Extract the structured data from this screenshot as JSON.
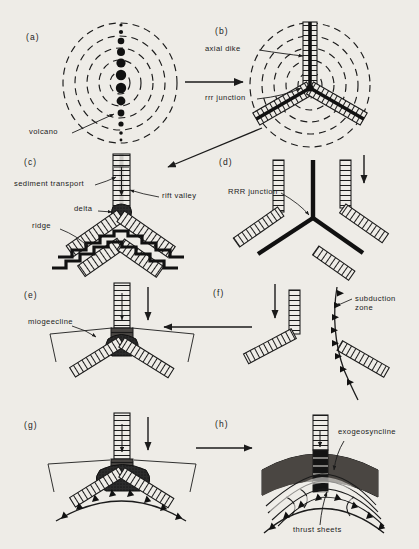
{
  "figure": {
    "background_color": "#eeece7",
    "ink_color": "#1b1b1b"
  },
  "panels": [
    {
      "id": "a",
      "letter": "(a)",
      "description": "Domal uplift with concentric dashed contours and a linear chain of volcanoes",
      "annotations": [
        {
          "name": "volcano",
          "text": "volcano"
        }
      ]
    },
    {
      "id": "b",
      "letter": "(b)",
      "description": "Three-armed rift system with axial dikes developing on the dome",
      "annotations": [
        {
          "name": "axial-dike",
          "text": "axial dike"
        },
        {
          "name": "rrr-junction",
          "text": "rrr junction"
        }
      ]
    },
    {
      "id": "c",
      "letter": "(c)",
      "description": "Rift valley with sediment transport, delta at junction, spreading ridges and magnetic stripes",
      "annotations": [
        {
          "name": "sediment-transport",
          "text": "sediment transport"
        },
        {
          "name": "rift-valley",
          "text": "rift valley"
        },
        {
          "name": "delta",
          "text": "delta"
        },
        {
          "name": "ridge",
          "text": "ridge"
        }
      ]
    },
    {
      "id": "d",
      "letter": "(d)",
      "description": "Mature RRR junction with three spreading ridges and transform-offset arms",
      "annotations": [
        {
          "name": "rrr-junction-caps",
          "text": "RRR junction"
        }
      ]
    },
    {
      "id": "e",
      "letter": "(e)",
      "description": "Failed arm aulacogen with miogeocline wedges flanking the junction",
      "annotations": [
        {
          "name": "miogeocline",
          "text": "miogeecline"
        }
      ]
    },
    {
      "id": "f",
      "letter": "(f)",
      "description": "Ridge arms consumed at a subduction zone marked by barbed trench line",
      "annotations": [
        {
          "name": "subduction-zone",
          "text": "subduction\nzone"
        }
      ]
    },
    {
      "id": "g",
      "letter": "(g)",
      "description": "Arc-trench system approaching the continental margin wedge",
      "annotations": []
    },
    {
      "id": "h",
      "letter": "(h)",
      "description": "Collision producing an exogeosyncline above stacked thrust sheets",
      "annotations": [
        {
          "name": "exogeosyncline",
          "text": "exogeosyncline"
        },
        {
          "name": "thrust-sheets",
          "text": "thrust sheets"
        }
      ]
    }
  ],
  "flow_arrows": [
    {
      "name": "arrow-a-to-b",
      "from": "a",
      "to": "b",
      "direction": "right"
    },
    {
      "name": "arrow-b-to-c",
      "from": "b",
      "to": "c",
      "direction": "down-left"
    },
    {
      "name": "arrow-c-to-d",
      "from": "c",
      "to": "d",
      "direction": "right"
    },
    {
      "name": "arrow-d-to-f",
      "from": "d",
      "to": "f",
      "direction": "down"
    },
    {
      "name": "arrow-f-to-e",
      "from": "f",
      "to": "e",
      "direction": "left"
    },
    {
      "name": "arrow-c-to-e",
      "from": "c",
      "to": "e",
      "direction": "down"
    },
    {
      "name": "arrow-e-to-g",
      "from": "e",
      "to": "g",
      "direction": "down"
    },
    {
      "name": "arrow-g-to-h",
      "from": "g",
      "to": "h",
      "direction": "right"
    }
  ]
}
